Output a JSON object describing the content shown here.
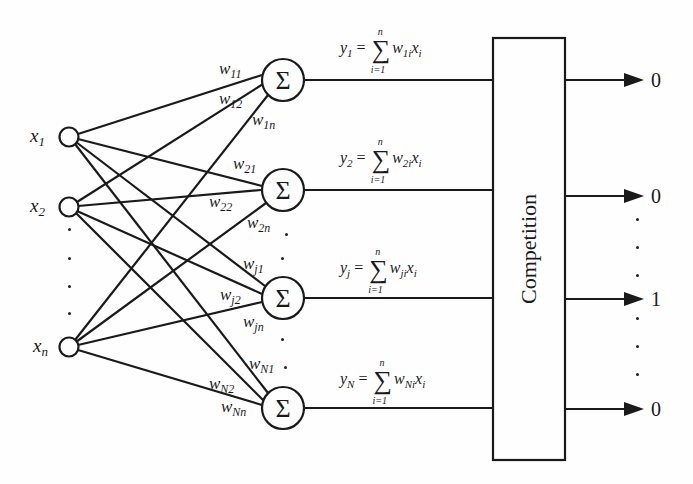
{
  "inputs": [
    {
      "label": "x",
      "sub": "1"
    },
    {
      "label": "x",
      "sub": "2"
    },
    {
      "label": "x",
      "sub": "n"
    }
  ],
  "sum_symbol": "Σ",
  "weights": {
    "w11": {
      "label": "w",
      "sub": "11"
    },
    "w12": {
      "label": "w",
      "sub": "12"
    },
    "w1n": {
      "label": "w",
      "sub": "1n"
    },
    "w21": {
      "label": "w",
      "sub": "21"
    },
    "w22": {
      "label": "w",
      "sub": "22"
    },
    "w2n": {
      "label": "w",
      "sub": "2n"
    },
    "wj1": {
      "label": "w",
      "sub": "j1"
    },
    "wj2": {
      "label": "w",
      "sub": "j2"
    },
    "wjn": {
      "label": "w",
      "sub": "jn"
    },
    "wN1": {
      "label": "w",
      "sub": "N1"
    },
    "wN2": {
      "label": "w",
      "sub": "N2"
    },
    "wNn": {
      "label": "w",
      "sub": "Nn"
    }
  },
  "equations": [
    {
      "y": "y",
      "ysub": "1",
      "eq": " = ",
      "upper": "n",
      "lower": "i=1",
      "w": "w",
      "wsub": "1i",
      "x": "x",
      "xsub": "i"
    },
    {
      "y": "y",
      "ysub": "2",
      "eq": " = ",
      "upper": "n",
      "lower": "i=1",
      "w": "w",
      "wsub": "2i",
      "x": "x",
      "xsub": "i"
    },
    {
      "y": "y",
      "ysub": "j",
      "eq": " = ",
      "upper": "n",
      "lower": "i=1",
      "w": "w",
      "wsub": "ji",
      "x": "x",
      "xsub": "i"
    },
    {
      "y": "y",
      "ysub": "N",
      "eq": " = ",
      "upper": "n",
      "lower": "i=1",
      "w": "w",
      "wsub": "Ni",
      "x": "x",
      "xsub": "i"
    }
  ],
  "competition": {
    "label": "Competition"
  },
  "outputs": [
    "0",
    "0",
    "1",
    "0"
  ]
}
